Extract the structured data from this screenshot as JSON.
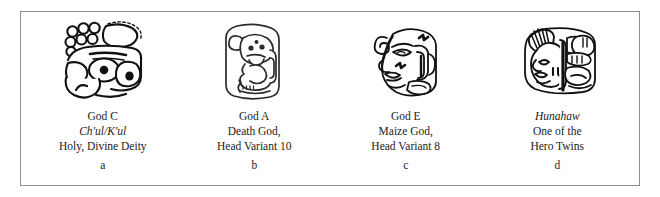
{
  "figure": {
    "background_color": "#ffffff",
    "frame_color": "#8d8d8d",
    "ink_color": "#111111",
    "columns": [
      {
        "panel_letter": "a",
        "glyph_name": "maya-glyph-god-c",
        "caption": {
          "line1": "God C",
          "line2": "Ch'ul/K'ul",
          "line2_italic": true,
          "line3": "Holy, Divine Deity"
        }
      },
      {
        "panel_letter": "b",
        "glyph_name": "maya-glyph-god-a-death-god",
        "caption": {
          "line1": "God A",
          "line2": "Death God,",
          "line2_italic": false,
          "line3": "Head Variant 10"
        }
      },
      {
        "panel_letter": "c",
        "glyph_name": "maya-glyph-god-e-maize-god",
        "caption": {
          "line1": "God E",
          "line2": "Maize God,",
          "line2_italic": false,
          "line3": "Head Variant 8"
        }
      },
      {
        "panel_letter": "d",
        "glyph_name": "maya-glyph-hunahaw-hero-twin",
        "caption": {
          "line1": "Hunahaw",
          "line1_italic": true,
          "line2": "One of the",
          "line2_italic": false,
          "line3": "Hero Twins"
        }
      }
    ]
  }
}
